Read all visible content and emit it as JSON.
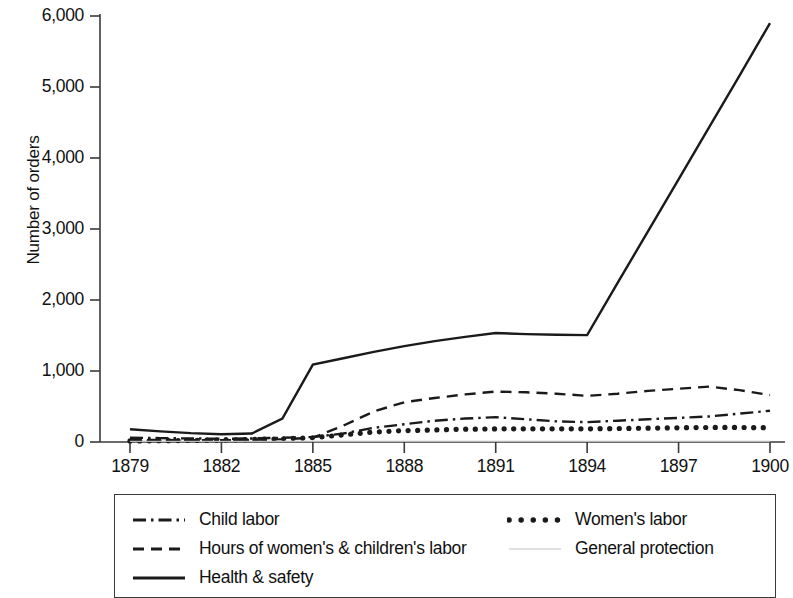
{
  "chart_data": {
    "type": "line",
    "title": "",
    "xlabel": "",
    "ylabel": "Number of orders",
    "xlim": [
      1879,
      1900
    ],
    "ylim": [
      0,
      6000
    ],
    "grid": false,
    "legend_position": "bottom",
    "x_ticks": [
      "1879",
      "1882",
      "1885",
      "1888",
      "1891",
      "1894",
      "1897",
      "1900"
    ],
    "x_tick_values": [
      1879,
      1882,
      1885,
      1888,
      1891,
      1894,
      1897,
      1900
    ],
    "y_ticks": [
      "0",
      "1,000",
      "2,000",
      "3,000",
      "4,000",
      "5,000",
      "6,000"
    ],
    "y_tick_values": [
      0,
      1000,
      2000,
      3000,
      4000,
      5000,
      6000
    ],
    "x": [
      1879,
      1880,
      1881,
      1882,
      1883,
      1884,
      1885,
      1886,
      1887,
      1888,
      1889,
      1890,
      1891,
      1892,
      1893,
      1894,
      1895,
      1896,
      1897,
      1898,
      1899,
      1900
    ],
    "series": [
      {
        "name": "Child labor",
        "style": "dash-dot",
        "color": "#1a1a1a",
        "values": [
          60,
          55,
          50,
          45,
          50,
          60,
          70,
          120,
          200,
          250,
          300,
          330,
          350,
          320,
          290,
          280,
          300,
          320,
          340,
          360,
          400,
          440
        ]
      },
      {
        "name": "Hours  of women's & children's labor",
        "style": "dashed",
        "color": "#1a1a1a",
        "values": [
          30,
          28,
          25,
          25,
          30,
          40,
          60,
          230,
          430,
          560,
          620,
          670,
          710,
          700,
          680,
          650,
          680,
          720,
          750,
          780,
          730,
          660
        ]
      },
      {
        "name": "Health & safety",
        "style": "solid",
        "color": "#1a1a1a",
        "values": [
          180,
          150,
          125,
          110,
          120,
          330,
          1090,
          1180,
          1270,
          1350,
          1420,
          1480,
          1535,
          1520,
          1510,
          1505,
          2240,
          2970,
          3700,
          4430,
          5160,
          5900
        ]
      },
      {
        "name": "Women's labor",
        "style": "dotted",
        "color": "#1a1a1a",
        "values": [
          15,
          18,
          22,
          28,
          35,
          45,
          60,
          100,
          140,
          160,
          170,
          180,
          185,
          185,
          185,
          185,
          190,
          195,
          200,
          205,
          205,
          200
        ]
      },
      {
        "name": "General protection",
        "style": "thin-light",
        "color": "#b9b9b9",
        "values": [
          8,
          8,
          8,
          8,
          8,
          8,
          8,
          8,
          8,
          8,
          8,
          8,
          8,
          8,
          8,
          8,
          8,
          8,
          8,
          8,
          8,
          8
        ]
      }
    ]
  },
  "legend": {
    "columns": [
      {
        "items": [
          {
            "label": "Child labor",
            "style": "dash-dot"
          },
          {
            "label": "Hours  of women's & children's labor",
            "style": "dashed"
          },
          {
            "label": "Health & safety",
            "style": "solid"
          }
        ]
      },
      {
        "items": [
          {
            "label": "Women's labor",
            "style": "dotted"
          },
          {
            "label": "General protection",
            "style": "thin-light"
          }
        ]
      }
    ]
  },
  "axis": {
    "y_title": "Number of orders"
  }
}
